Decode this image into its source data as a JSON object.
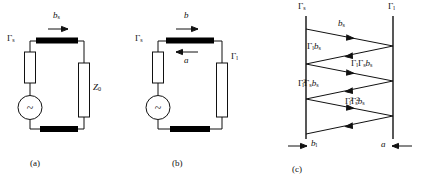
{
  "figure": {
    "line_color": "#111111",
    "bar_color": "#000000",
    "background": "#ffffff"
  },
  "panel_a": {
    "caption": "(a)",
    "source_reflection_label": "Γ",
    "source_reflection_sub": "s",
    "load_label": "Z",
    "load_sub": "0",
    "wave_label": "b",
    "wave_sub": "s",
    "source_symbol": "~",
    "arrow_direction": "right"
  },
  "panel_b": {
    "caption": "(b)",
    "source_reflection_label": "Γ",
    "source_reflection_sub": "s",
    "load_reflection_label": "Γ",
    "load_reflection_sub": "l",
    "forward_wave_label": "b",
    "reverse_wave_label": "a",
    "source_symbol": "~",
    "forward_arrow_direction": "right",
    "reverse_arrow_direction": "left"
  },
  "panel_c": {
    "caption": "(c)",
    "left_port_label": "Γ",
    "left_port_sub": "s",
    "right_port_label": "Γ",
    "right_port_sub": "l",
    "bottom_left_label": "b",
    "bottom_left_sub": "l",
    "bottom_right_label": "a",
    "bottom_left_arrow_direction": "right",
    "bottom_right_arrow_direction": "left",
    "bounces": [
      {
        "index": 1,
        "direction": "right",
        "terms": [
          {
            "sym": "b",
            "sub": "s",
            "sup": ""
          }
        ]
      },
      {
        "index": 2,
        "direction": "left",
        "terms": [
          {
            "sym": "Γ",
            "sub": "l",
            "sup": ""
          },
          {
            "sym": "b",
            "sub": "s",
            "sup": ""
          }
        ]
      },
      {
        "index": 3,
        "direction": "right",
        "terms": [
          {
            "sym": "Γ",
            "sub": "l",
            "sup": ""
          },
          {
            "sym": "Γ",
            "sub": "s",
            "sup": ""
          },
          {
            "sym": "b",
            "sub": "s",
            "sup": ""
          }
        ]
      },
      {
        "index": 4,
        "direction": "left",
        "terms": [
          {
            "sym": "Γ",
            "sub": "l",
            "sup": "2"
          },
          {
            "sym": "Γ",
            "sub": "s",
            "sup": ""
          },
          {
            "sym": "b",
            "sub": "s",
            "sup": ""
          }
        ]
      },
      {
        "index": 5,
        "direction": "right",
        "terms": [
          {
            "sym": "Γ",
            "sub": "l",
            "sup": "2"
          },
          {
            "sym": "Γ",
            "sub": "s",
            "sup": "2"
          },
          {
            "sym": "b",
            "sub": "s",
            "sup": ""
          }
        ]
      },
      {
        "index": 6,
        "direction": "left",
        "terms": []
      }
    ]
  }
}
